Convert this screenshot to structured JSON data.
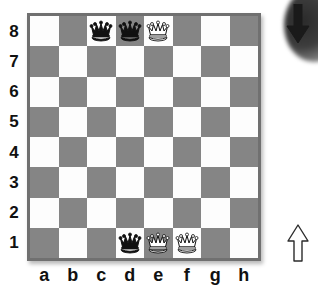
{
  "board": {
    "files": [
      "a",
      "b",
      "c",
      "d",
      "e",
      "f",
      "g",
      "h"
    ],
    "ranks": [
      "8",
      "7",
      "6",
      "5",
      "4",
      "3",
      "2",
      "1"
    ],
    "light_square_color": "#fdfdfd",
    "dark_square_color": "#858585",
    "border_color": "#707070",
    "squares": [
      [
        {
          "square": "a8",
          "shade": "light",
          "piece": null
        },
        {
          "square": "b8",
          "shade": "dark",
          "piece": null
        },
        {
          "square": "c8",
          "shade": "light",
          "piece": "black-queen"
        },
        {
          "square": "d8",
          "shade": "dark",
          "piece": "black-queen"
        },
        {
          "square": "e8",
          "shade": "light",
          "piece": "white-queen"
        },
        {
          "square": "f8",
          "shade": "dark",
          "piece": null
        },
        {
          "square": "g8",
          "shade": "light",
          "piece": null
        },
        {
          "square": "h8",
          "shade": "dark",
          "piece": null
        }
      ],
      [
        {
          "square": "a7",
          "shade": "dark",
          "piece": null
        },
        {
          "square": "b7",
          "shade": "light",
          "piece": null
        },
        {
          "square": "c7",
          "shade": "dark",
          "piece": null
        },
        {
          "square": "d7",
          "shade": "light",
          "piece": null
        },
        {
          "square": "e7",
          "shade": "dark",
          "piece": null
        },
        {
          "square": "f7",
          "shade": "light",
          "piece": null
        },
        {
          "square": "g7",
          "shade": "dark",
          "piece": null
        },
        {
          "square": "h7",
          "shade": "light",
          "piece": null
        }
      ],
      [
        {
          "square": "a6",
          "shade": "light",
          "piece": null
        },
        {
          "square": "b6",
          "shade": "dark",
          "piece": null
        },
        {
          "square": "c6",
          "shade": "light",
          "piece": null
        },
        {
          "square": "d6",
          "shade": "dark",
          "piece": null
        },
        {
          "square": "e6",
          "shade": "light",
          "piece": null
        },
        {
          "square": "f6",
          "shade": "dark",
          "piece": null
        },
        {
          "square": "g6",
          "shade": "light",
          "piece": null
        },
        {
          "square": "h6",
          "shade": "dark",
          "piece": null
        }
      ],
      [
        {
          "square": "a5",
          "shade": "dark",
          "piece": null
        },
        {
          "square": "b5",
          "shade": "light",
          "piece": null
        },
        {
          "square": "c5",
          "shade": "dark",
          "piece": null
        },
        {
          "square": "d5",
          "shade": "light",
          "piece": null
        },
        {
          "square": "e5",
          "shade": "dark",
          "piece": null
        },
        {
          "square": "f5",
          "shade": "light",
          "piece": null
        },
        {
          "square": "g5",
          "shade": "dark",
          "piece": null
        },
        {
          "square": "h5",
          "shade": "light",
          "piece": null
        }
      ],
      [
        {
          "square": "a4",
          "shade": "light",
          "piece": null
        },
        {
          "square": "b4",
          "shade": "dark",
          "piece": null
        },
        {
          "square": "c4",
          "shade": "light",
          "piece": null
        },
        {
          "square": "d4",
          "shade": "dark",
          "piece": null
        },
        {
          "square": "e4",
          "shade": "light",
          "piece": null
        },
        {
          "square": "f4",
          "shade": "dark",
          "piece": null
        },
        {
          "square": "g4",
          "shade": "light",
          "piece": null
        },
        {
          "square": "h4",
          "shade": "dark",
          "piece": null
        }
      ],
      [
        {
          "square": "a3",
          "shade": "dark",
          "piece": null
        },
        {
          "square": "b3",
          "shade": "light",
          "piece": null
        },
        {
          "square": "c3",
          "shade": "dark",
          "piece": null
        },
        {
          "square": "d3",
          "shade": "light",
          "piece": null
        },
        {
          "square": "e3",
          "shade": "dark",
          "piece": null
        },
        {
          "square": "f3",
          "shade": "light",
          "piece": null
        },
        {
          "square": "g3",
          "shade": "dark",
          "piece": null
        },
        {
          "square": "h3",
          "shade": "light",
          "piece": null
        }
      ],
      [
        {
          "square": "a2",
          "shade": "light",
          "piece": null
        },
        {
          "square": "b2",
          "shade": "dark",
          "piece": null
        },
        {
          "square": "c2",
          "shade": "light",
          "piece": null
        },
        {
          "square": "d2",
          "shade": "dark",
          "piece": null
        },
        {
          "square": "e2",
          "shade": "light",
          "piece": null
        },
        {
          "square": "f2",
          "shade": "dark",
          "piece": null
        },
        {
          "square": "g2",
          "shade": "light",
          "piece": null
        },
        {
          "square": "h2",
          "shade": "dark",
          "piece": null
        }
      ],
      [
        {
          "square": "a1",
          "shade": "dark",
          "piece": null
        },
        {
          "square": "b1",
          "shade": "light",
          "piece": null
        },
        {
          "square": "c1",
          "shade": "dark",
          "piece": null
        },
        {
          "square": "d1",
          "shade": "light",
          "piece": "black-queen"
        },
        {
          "square": "e1",
          "shade": "dark",
          "piece": "white-queen"
        },
        {
          "square": "f1",
          "shade": "light",
          "piece": "white-queen"
        },
        {
          "square": "g1",
          "shade": "dark",
          "piece": null
        },
        {
          "square": "h1",
          "shade": "light",
          "piece": null
        }
      ]
    ]
  },
  "annotations": {
    "top_arrow": {
      "icon": "arrow-down-icon",
      "fill": "#1a1a1a",
      "direction": "down"
    },
    "bottom_arrow": {
      "icon": "arrow-up-icon",
      "fill": "#ffffff",
      "direction": "up"
    },
    "corner_blob": {
      "icon": "blurred-circle-decoration"
    }
  }
}
